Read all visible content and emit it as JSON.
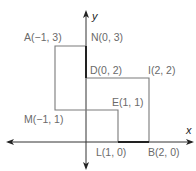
{
  "diagram": {
    "axes": {
      "x_label": "x",
      "y_label": "y"
    },
    "points": [
      {
        "name": "A",
        "label": "A(−1, 3)",
        "x": -1,
        "y": 3
      },
      {
        "name": "N",
        "label": "N(0, 3)",
        "x": 0,
        "y": 3
      },
      {
        "name": "D",
        "label": "D(0, 2)",
        "x": 0,
        "y": 2
      },
      {
        "name": "I",
        "label": "I(2, 2)",
        "x": 2,
        "y": 2
      },
      {
        "name": "E",
        "label": "E(1, 1)",
        "x": 1,
        "y": 1
      },
      {
        "name": "M",
        "label": "M(−1, 1)",
        "x": -1,
        "y": 1
      },
      {
        "name": "L",
        "label": "L(1, 0)",
        "x": 1,
        "y": 0
      },
      {
        "name": "B",
        "label": "B(2, 0)",
        "x": 2,
        "y": 0
      }
    ],
    "shapes": [
      {
        "name": "rectangle-ANLM-region",
        "vertices": [
          "A",
          "N",
          "(0,1)",
          "M"
        ]
      },
      {
        "name": "polygon-DIBL-E",
        "vertices": [
          "D",
          "I",
          "B",
          "L",
          "E",
          "(0,1)"
        ]
      }
    ],
    "colors": {
      "line": "#7a7a7a",
      "axis": "#333333",
      "label": "#6a6a6a"
    }
  }
}
